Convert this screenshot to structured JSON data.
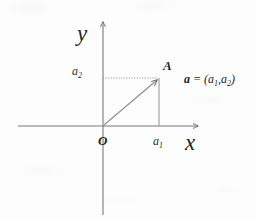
{
  "figure": {
    "title": "",
    "type": "cartesian-vector-diagram",
    "background_color": "#fdfdfd",
    "ink_color": "#5a5a5a",
    "text_color": "#1f1f1f"
  },
  "axes": {
    "x_axis": {
      "label": "x",
      "y_pixel": 126,
      "x_start": 18,
      "x_end": 200,
      "arrow": "right"
    },
    "y_axis": {
      "label": "y",
      "x_pixel": 103,
      "y_start": 20,
      "y_end": 215,
      "arrow": "up"
    }
  },
  "origin": {
    "label": "O",
    "x": 103,
    "y": 126
  },
  "point": {
    "label": "A",
    "x": 160,
    "y": 78
  },
  "ticks": {
    "x_tick_label": "a",
    "x_tick_sub": "1",
    "y_tick_label": "a",
    "y_tick_sub": "2"
  },
  "vector": {
    "name": "a",
    "equals": "=",
    "open_paren": "(",
    "comp1": "a",
    "comp1_sub": "1",
    "comma": ",",
    "comp2": "a",
    "comp2_sub": "2",
    "close_paren": ")",
    "full_text": "a = (a1,a2)"
  },
  "guides": {
    "horizontal_style": "dotted",
    "vertical_style": "solid",
    "description": "projection lines from point A to the axes"
  }
}
